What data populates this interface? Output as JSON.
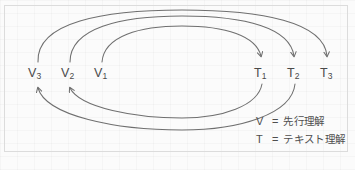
{
  "figure": {
    "title": "",
    "stroke_color": "#6f6f6f",
    "text_color": "#4a4a4a",
    "background_color": "#fbfbfb",
    "frame_color": "#dcdcdc"
  },
  "nodes": {
    "v": [
      {
        "id": "V3",
        "base": "V",
        "sub": "3",
        "x": 28,
        "y": 66
      },
      {
        "id": "V2",
        "base": "V",
        "sub": "2",
        "x": 61,
        "y": 66
      },
      {
        "id": "V1",
        "base": "V",
        "sub": "1",
        "x": 94,
        "y": 66
      }
    ],
    "t": [
      {
        "id": "T1",
        "base": "T",
        "sub": "1",
        "x": 254,
        "y": 66
      },
      {
        "id": "T2",
        "base": "T",
        "sub": "2",
        "x": 287,
        "y": 66
      },
      {
        "id": "T3",
        "base": "T",
        "sub": "3",
        "x": 320,
        "y": 66
      }
    ]
  },
  "arcs": {
    "upper": [
      {
        "from": "V1",
        "to": "T1",
        "direction": "right",
        "path": "M 102 62 C 104 36 140 26 182 26 C 226 26 256 36 261 56"
      },
      {
        "from": "V2",
        "to": "T2",
        "direction": "right",
        "path": "M 70 62 C 70 28 120 16 182 16 C 246 16 290 28 294 56"
      },
      {
        "from": "V3",
        "to": "T3",
        "direction": "right",
        "path": "M 38 62 C 36 22 104 10 182 10 C 262 10 324 22 327 56"
      }
    ],
    "lower": [
      {
        "from": "T1",
        "to": "V2",
        "direction": "left",
        "path": "M 262 84 C 258 106 222 118 182 118 C 136 118 80 108 70 88"
      },
      {
        "from": "T2",
        "to": "V3",
        "direction": "left",
        "path": "M 295 84 C 292 114 240 130 182 130 C 116 130 46 116 38 88"
      }
    ]
  },
  "legend": {
    "rows": [
      {
        "symbol": "V",
        "equals": "=",
        "text": "先行理解"
      },
      {
        "symbol": "T",
        "equals": "=",
        "text": "テキスト理解"
      }
    ]
  }
}
